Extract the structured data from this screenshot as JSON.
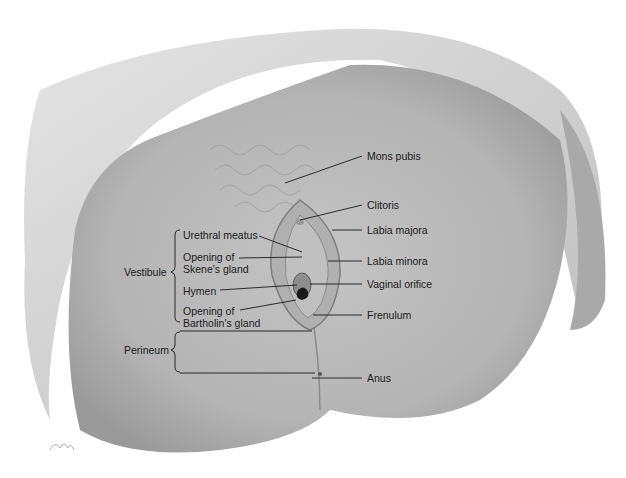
{
  "diagram": {
    "type": "anatomical-illustration",
    "labels_right": [
      {
        "id": "mons-pubis",
        "text": "Mons pubis",
        "x": 367,
        "y": 155
      },
      {
        "id": "clitoris",
        "text": "Clitoris",
        "x": 367,
        "y": 204
      },
      {
        "id": "labia-majora",
        "text": "Labia majora",
        "x": 367,
        "y": 229
      },
      {
        "id": "labia-minora",
        "text": "Labia minora",
        "x": 367,
        "y": 258
      },
      {
        "id": "vaginal-orifice",
        "text": "Vaginal orifice",
        "x": 367,
        "y": 282
      },
      {
        "id": "frenulum",
        "text": "Frenulum",
        "x": 367,
        "y": 310
      },
      {
        "id": "anus",
        "text": "Anus",
        "x": 367,
        "y": 372
      }
    ],
    "labels_left": [
      {
        "id": "urethral-meatus",
        "text": "Urethral meatus",
        "x": 183,
        "y": 231
      },
      {
        "id": "skene-1",
        "text": "Opening of",
        "x": 183,
        "y": 252
      },
      {
        "id": "skene-2",
        "text": "Skene's gland",
        "x": 183,
        "y": 264
      },
      {
        "id": "hymen",
        "text": "Hymen",
        "x": 183,
        "y": 285
      },
      {
        "id": "bartholin-1",
        "text": "Opening of",
        "x": 183,
        "y": 306
      },
      {
        "id": "bartholin-2",
        "text": "Bartholin's gland",
        "x": 183,
        "y": 318
      }
    ],
    "group_labels": [
      {
        "id": "vestibule",
        "text": "Vestibule",
        "x": 124,
        "y": 271
      },
      {
        "id": "perineum",
        "text": "Perineum",
        "x": 124,
        "y": 347
      }
    ]
  }
}
